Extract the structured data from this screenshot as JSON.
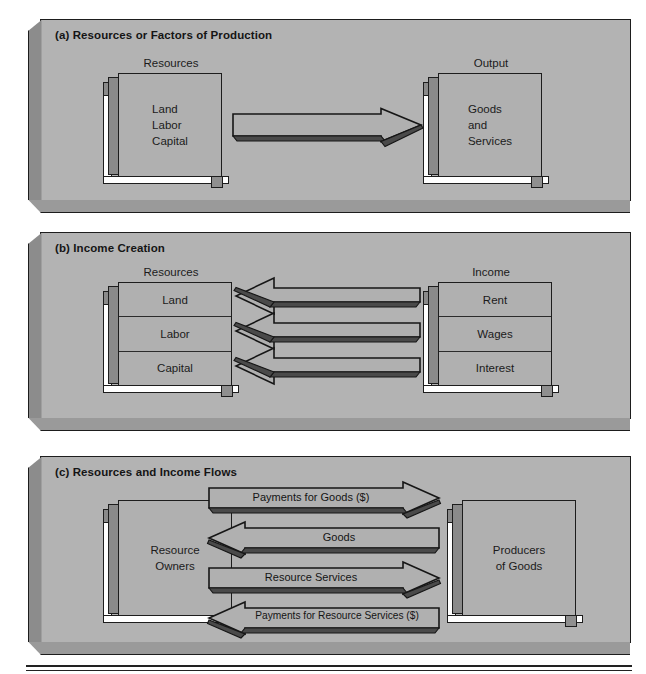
{
  "figure": {
    "panels": [
      {
        "id": "a",
        "title": "(a) Resources or Factors of Production",
        "left_caption": "Resources",
        "right_caption": "Output",
        "left_box_lines": [
          "Land",
          "Labor",
          "Capital"
        ],
        "right_box_lines": [
          "Goods",
          "and",
          "Services"
        ],
        "arrows": [
          {
            "label": "",
            "direction": "right"
          }
        ]
      },
      {
        "id": "b",
        "title": "(b) Income Creation",
        "left_caption": "Resources",
        "right_caption": "Income",
        "left_segments": [
          "Land",
          "Labor",
          "Capital"
        ],
        "right_segments": [
          "Rent",
          "Wages",
          "Interest"
        ],
        "arrows": [
          {
            "label": "",
            "direction": "left"
          },
          {
            "label": "",
            "direction": "left"
          },
          {
            "label": "",
            "direction": "left"
          }
        ]
      },
      {
        "id": "c",
        "title": "(c) Resources and Income Flows",
        "left_box_lines": [
          "Resource",
          "Owners"
        ],
        "right_box_lines": [
          "Producers",
          "of Goods"
        ],
        "arrows": [
          {
            "label": "Payments for Goods ($)",
            "direction": "right"
          },
          {
            "label": "Goods",
            "direction": "left"
          },
          {
            "label": "Resource Services",
            "direction": "right"
          },
          {
            "label": "Payments for Resource Services ($)",
            "direction": "left"
          }
        ]
      }
    ],
    "colors": {
      "panel_fill": "#b3b3b3",
      "box_face": "#b0b0b0",
      "box_side": "#8a8a8a",
      "outline": "#1d1d1d",
      "arrow_fill": "#b0b0b0",
      "page_background": "#ffffff"
    }
  }
}
